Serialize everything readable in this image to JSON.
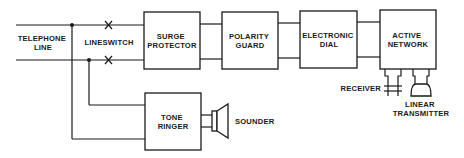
{
  "diagram": {
    "colors": {
      "line": "#1a1a1a",
      "background": "#ffffff"
    },
    "labels": {
      "telephone_line": [
        "TELEPHONE",
        "LINE"
      ],
      "lineswitch": [
        "LINESWITCH"
      ],
      "sounder": [
        "SOUNDER"
      ],
      "receiver": [
        "RECEIVER"
      ],
      "linear_transmitter": [
        "LINEAR",
        "TRANSMITTER"
      ]
    },
    "blocks": [
      {
        "id": "surge-protector",
        "lines": [
          "SURGE",
          "PROTECTOR"
        ]
      },
      {
        "id": "polarity-guard",
        "lines": [
          "POLARITY",
          "GUARD"
        ]
      },
      {
        "id": "electronic-dial",
        "lines": [
          "ELECTRONIC",
          "DIAL"
        ]
      },
      {
        "id": "active-network",
        "lines": [
          "ACTIVE",
          "NETWORK"
        ]
      },
      {
        "id": "tone-ringer",
        "lines": [
          "TONE",
          "RINGER"
        ]
      }
    ],
    "icons": [
      "switch-contact-icon",
      "junction-dot-icon",
      "speaker-icon",
      "earpiece-icon",
      "microphone-icon"
    ]
  }
}
